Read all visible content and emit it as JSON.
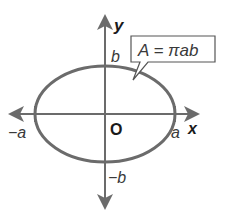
{
  "diagram": {
    "formula": "A = πab",
    "axes": {
      "x_label": "x",
      "y_label": "y",
      "origin_label": "O"
    },
    "intercepts": {
      "pos_x": "a",
      "neg_x": "−a",
      "pos_y": "b",
      "neg_y": "−b"
    },
    "colors": {
      "curve": "#6b6b6b",
      "axes": "#6b6b6b",
      "text": "#333333"
    }
  }
}
